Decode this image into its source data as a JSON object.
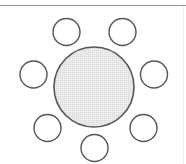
{
  "diagram": {
    "type": "seating-arrangement",
    "table": {
      "cx": 94,
      "cy": 87,
      "r": 40,
      "fill": "#e6e6e6",
      "stroke": "#555555"
    },
    "chairs": [
      {
        "cx": 66.5,
        "cy": 32,
        "r": 13.5
      },
      {
        "cx": 122.5,
        "cy": 32,
        "r": 13.5
      },
      {
        "cx": 33.5,
        "cy": 74.5,
        "r": 13.5
      },
      {
        "cx": 154,
        "cy": 74.5,
        "r": 13.5
      },
      {
        "cx": 47.5,
        "cy": 128,
        "r": 13.5
      },
      {
        "cx": 143.5,
        "cy": 128,
        "r": 13.5
      },
      {
        "cx": 94.5,
        "cy": 148,
        "r": 13.5
      }
    ],
    "chair_stroke": "#555555",
    "chair_count": 7
  }
}
